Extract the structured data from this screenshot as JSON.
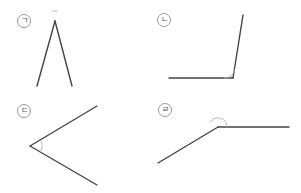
{
  "figure": {
    "width": 301,
    "height": 193,
    "line_color": "#444444",
    "arc_color": "#b0b0b0",
    "label_color": "#555555",
    "panels": [
      {
        "id": "a",
        "label": "ㄱ",
        "label_center": [
          24,
          21
        ],
        "vertex": [
          55,
          21
        ],
        "ray1_end": [
          37,
          86
        ],
        "ray2_end": [
          72,
          86
        ],
        "arc": {
          "r": 10,
          "start_deg": 105,
          "end_deg": 75,
          "sweep": 0
        }
      },
      {
        "id": "b",
        "label": "ㄴ",
        "label_center": [
          164,
          20
        ],
        "vertex": [
          233,
          78
        ],
        "ray1_end": [
          169,
          78
        ],
        "ray2_end": [
          243,
          15
        ],
        "arc": {
          "r": 9,
          "start_deg": 180,
          "end_deg": 81,
          "sweep": 1
        }
      },
      {
        "id": "c",
        "label": "ㄷ",
        "label_center": [
          24,
          111
        ],
        "vertex": [
          30,
          146
        ],
        "ray1_end": [
          97,
          106
        ],
        "ray2_end": [
          97,
          185
        ],
        "arc": {
          "r": 12,
          "start_deg": -31,
          "end_deg": 30,
          "sweep": 1
        }
      },
      {
        "id": "d",
        "label": "ㄹ",
        "label_center": [
          165,
          110
        ],
        "vertex": [
          218,
          127
        ],
        "ray1_end": [
          289,
          127
        ],
        "ray2_end": [
          158,
          163
        ],
        "arc": {
          "r": 9,
          "start_deg": 0,
          "end_deg": 149,
          "sweep": 1
        }
      }
    ]
  }
}
